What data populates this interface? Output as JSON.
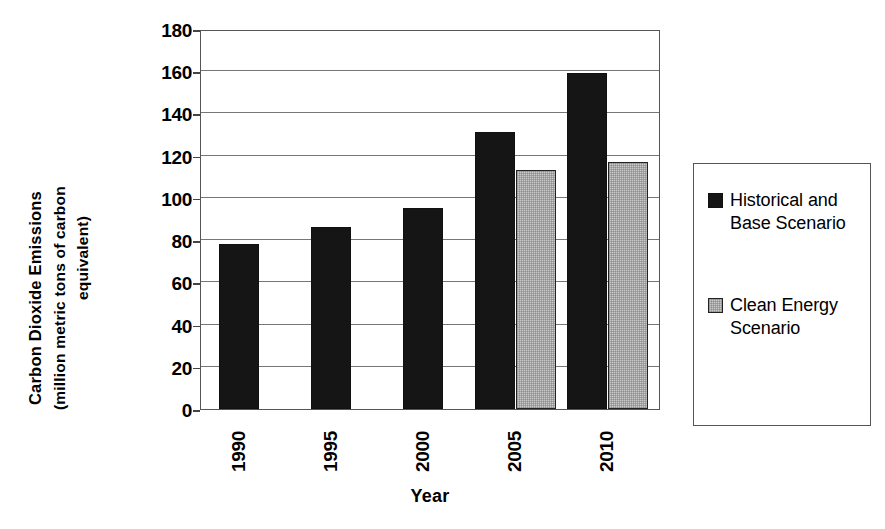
{
  "chart_data": {
    "type": "bar",
    "title": "",
    "categories": [
      "1990",
      "1995",
      "2000",
      "2005",
      "2010"
    ],
    "series": [
      {
        "name": "Historical and Base Scenario",
        "color": "#151515",
        "values": [
          78,
          86,
          95,
          131,
          159
        ]
      },
      {
        "name": "Clean Energy Scenario",
        "color": "#c9c9c9",
        "values": [
          null,
          null,
          null,
          113,
          117
        ]
      }
    ],
    "xlabel": "Year",
    "ylabel": "Carbon Dioxide Emissions (million metric tons of carbon equivalent)",
    "ylim": [
      0,
      180
    ],
    "yticks": [
      0,
      20,
      40,
      60,
      80,
      100,
      120,
      140,
      160,
      180
    ],
    "ytick_labels": [
      "0",
      "20",
      "40",
      "60",
      "80",
      "100",
      "120",
      "140",
      "160",
      "180"
    ],
    "grid": true,
    "legend_position": "right"
  },
  "axes": {
    "y_title_line1": "Carbon Dioxide Emissions",
    "y_title_line2": "(million metric tons of carbon",
    "y_title_line3": "equivalent)",
    "x_title": "Year"
  },
  "legend": {
    "entries": [
      {
        "label": "Historical and Base Scenario",
        "color": "#151515"
      },
      {
        "label": "Clean Energy Scenario",
        "color": "#c9c9c9"
      }
    ]
  }
}
